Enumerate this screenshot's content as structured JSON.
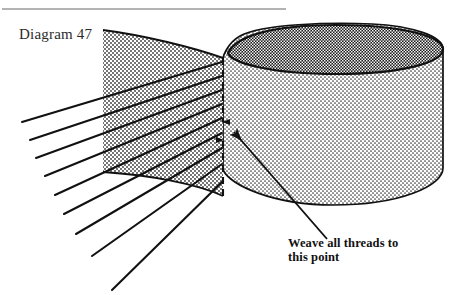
{
  "figure": {
    "title_label": "Diagram 47",
    "callout": {
      "line1": "Weave all threads to",
      "line2": "this point"
    },
    "colors": {
      "ink": "#111111",
      "rule": "#9a9a9a",
      "label_text": "#2b2b2b",
      "cylinder_top_fill": "#4a4a4a",
      "cylinder_body_fill": "#e8e8e8",
      "fabric_fill": "#dcdcdc",
      "paper": "#ffffff"
    },
    "elements": {
      "top_rule_name": "header-rule",
      "cylinder_name": "cylinder-drum",
      "cylinder_top_name": "cylinder-top-ellipse",
      "fabric_name": "fabric-panel",
      "threads_name": "thread-lines",
      "dashed_name": "convergence-dashed-line",
      "pointer_name": "callout-pointer-arrow"
    },
    "geometry": {
      "top_rule": {
        "x1": 2,
        "y1": 9,
        "x2": 286,
        "y2": 9
      },
      "convergence_point": {
        "x": 223,
        "y": 131
      },
      "dashed_line": {
        "x": 223,
        "y_top": 58,
        "y_bottom": 196
      },
      "cylinder": {
        "left": 223,
        "right": 443,
        "top": 25,
        "body_bottom": 190,
        "ellipse_ry": 24
      },
      "fabric_panel": {
        "left": 103,
        "apex_x": 223,
        "top": 30,
        "bottom": 172
      },
      "thread_count": 9
    }
  }
}
